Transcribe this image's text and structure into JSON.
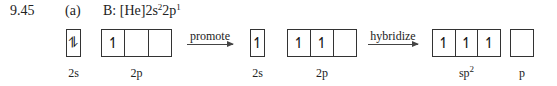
{
  "problem": {
    "number": "9.45",
    "part": "(a)",
    "config_prefix": "B: [He]2s",
    "config_s_exp": "2",
    "config_mid": "2p",
    "config_p_exp": "1"
  },
  "ground_state": {
    "s_orbital": {
      "label": "2s",
      "cells": [
        "⥮"
      ]
    },
    "p_orbitals": {
      "label": "2p",
      "cells": [
        "↿",
        "",
        ""
      ]
    }
  },
  "step1": {
    "label": "promote"
  },
  "promoted_state": {
    "s_orbital": {
      "label": "2s",
      "cells": [
        "↿"
      ]
    },
    "p_orbitals": {
      "label": "2p",
      "cells": [
        "↿",
        "↿",
        ""
      ]
    }
  },
  "step2": {
    "label": "hybridize"
  },
  "hybrid_state": {
    "sp2_orbitals": {
      "label_base": "sp",
      "label_exp": "2",
      "cells": [
        "↿",
        "↿",
        "↿"
      ]
    },
    "p_orbital": {
      "label": "p",
      "cells": [
        ""
      ]
    }
  }
}
